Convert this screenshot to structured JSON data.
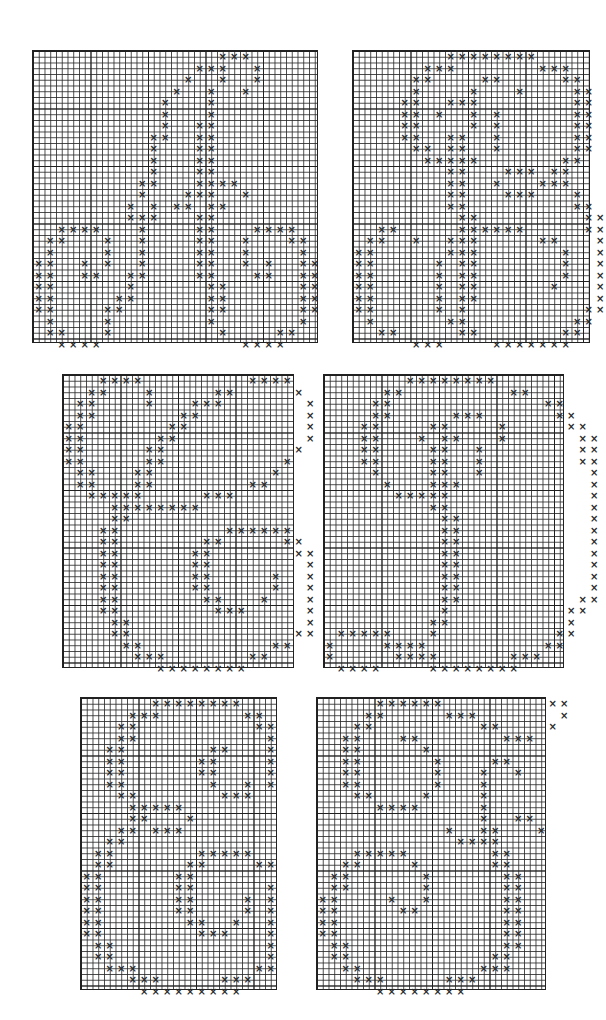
{
  "page": {
    "background": "#ffffff",
    "ink": "#2a2a2a",
    "mark_glyph": "×"
  },
  "charts": [
    {
      "name": "chart-1",
      "left": 32,
      "top": 50,
      "width": 286,
      "height": 293,
      "cell": 11.5,
      "rows": [
        "................xxx......",
        "..............xxx..x.....",
        ".............x..x..x.....",
        "............x..x..x......",
        "...........x...x.........",
        "...........x...x.........",
        "...........x..xx.........",
        "..........xx..xx.........",
        "..........x...xx.........",
        "..........x...xx.........",
        "..........x...xx.........",
        ".........xx...xxxx.......",
        ".........x...xxx..x......",
        "........x.x.xx.xx........",
        "........xxx...xx.........",
        "..xxxx...x....xx...xxxx..",
        ".xx...x..x....xx..x...xx.",
        ".x....x..x....xx..x....x.",
        "xx..x.x..x....xx..x.x..xx",
        "xx..xx..xx....xx...xx..xx",
        "xx......x......xx......xx",
        "xx.....xx......xx......xx",
        "xx....xx.......xx......xx",
        ".x....x........x.......x.",
        ".xx...x.........x....xx..",
        "..xxxx............xxxx..."
      ]
    },
    {
      "name": "chart-2",
      "left": 352,
      "top": 50,
      "width": 238,
      "height": 293,
      "cell": 11.5,
      "rows": [
        "........xxxxxxxx.....",
        "......xxx.......xxx..",
        ".....xx....xx.....xx.",
        ".....x....x...x....xx",
        "....xx..xxx........xx",
        "....xx.x..x.x......xx",
        "....xx....x.x......xx",
        "....xx..xx..x......xx",
        ".....xx.xx..x......xx",
        "......xxxxx.......xx.",
        "........xx...xxx.xx..",
        "........xx..x...xxx..",
        "........xx...xxx...x.",
        "........xx.........xx",
        ".........xx.........xx",
        "..xx.....xxxxxx.....xx",
        ".xx..x..xxx.....xx...x",
        "xx......xxx.......x..x",
        "xx.....x.xx.......x..x",
        "xx.....x.xx.......x..x",
        "xx.....x.xx......x...x",
        "xx.....x.xx..........x",
        "xx.....x.x..........xx",
        ".x......xx.........xx.",
        "..xx.....xx.......xx..",
        ".....xxx....xxxxxxx..."
      ]
    },
    {
      "name": "chart-3",
      "left": 62,
      "top": 374,
      "width": 232,
      "height": 294,
      "cell": 11.5,
      "rows": [
        "...xxxx.........xxxx.",
        "..xx...x.....xx.....x",
        ".xx....x...xxx.......x",
        ".xx.......xx.........x",
        "xx.......xx..........x",
        "xx......xx...........x",
        "xx.....xx...........x.",
        "xx.....xx..........x..",
        ".xx...xx..........x...",
        ".xx...xx........xx....",
        "..xxxxx.....xxx.......",
        "....xxxxxxxx..........",
        "....xx................",
        "...xx.........xxxxxx..",
        "...xx.......xx.....xx.",
        "...xx......xx.......xx",
        "...xx......xx........x",
        "...xx......xx.....x..x",
        "...xx......xx.....x..x",
        "...xx.......xx...x...x",
        "...xx........xxx.....x",
        "....xx...............x",
        "....xx..............xx",
        ".....xx...........xx..",
        "......xxx.......xx....",
        "........xxxxxxxx......"
      ]
    },
    {
      "name": "chart-4",
      "left": 323,
      "top": 374,
      "width": 241,
      "height": 294,
      "cell": 11.5,
      "rows": [
        ".......xxxxxxxx.........",
        ".....xx.........xx......",
        "....xx.............xx...",
        "....xx.....xxx......xx..",
        "...xx....xx....x.....xx.",
        "...xx...x.xx...x......xx",
        "...xx....xx..x........xx",
        "...xx....xx..x........xx",
        "....x....xx..x.........x",
        ".....x...xxx...........x",
        "......xxxxx............x",
        ".........xx............x",
        "..........xx...........x",
        "..........xx...........x",
        "..........xx...........x",
        "..........xx...........x",
        "..........xx...........x",
        "..........xx...........x",
        "..........xx...........x",
        "..........xx..........xx",
        "..........x..........xx.",
        ".........xx..........x..",
        ".xxxxx...x..........xx..",
        "x....xxxx..........xx...",
        "x.....xxxx......xxx.....",
        ".xxxx....xxxxxxxx......."
      ]
    },
    {
      "name": "chart-5",
      "left": 80,
      "top": 697,
      "width": 197,
      "height": 293,
      "cell": 11.5,
      "rows": [
        "......xxxxxxxx...",
        "....xxx.......xx.",
        "...xx..........xx",
        "...xx...........x",
        "..xx.......xx...x",
        "..xx......xx....x",
        "..xx......xx....x",
        "..xx.......x..x.x",
        "...xx.......xxx..",
        "....xxxxx........",
        "....xx...x.......",
        "...xx.xxx........",
        "..xx.............",
        ".xx.......xxxxx..",
        ".xx......xx....xx",
        "xx......xx.......",
        "xx......xx......x",
        "xx......xx....x.x",
        "xx......xx....x.x",
        "xx.......xx..x..x",
        "xx........xxx...x",
        ".xx.............x",
        ".xx.............x",
        "..xxx..........xx",
        "....xxx.....xxx..",
        ".....xxxxxxxxx..."
      ]
    },
    {
      "name": "chart-6",
      "left": 316,
      "top": 697,
      "width": 230,
      "height": 293,
      "cell": 11.5,
      "rows": [
        ".....xxxxxx.........xx",
        "....xx.....xxx.......x",
        "...xx.........xx....x.",
        "..xx...xx.......xxx...",
        "..xx.....x............",
        "..xx......x....xx.....",
        "..xx......x...x..x....",
        "..xx......x...x.......",
        "...xx....x....x.......",
        ".....xxxx.....x.......",
        "..............x..xx...",
        "...........x..xx...x..",
        "............xxxx......",
        "...xxxxx.......xx.....",
        "..xx....x......xx.....",
        ".xx......x......xx....",
        ".xx......x......xx....",
        "xx....x..x......xx....",
        "xx.....xx.......xx....",
        "xx..............xx....",
        "xx..............xx....",
        ".xx.............xx....",
        ".xx............xx.....",
        "..xx..........xxx.....",
        "...xxx.....xxx........",
        ".....xxxxxxxx........."
      ]
    }
  ]
}
